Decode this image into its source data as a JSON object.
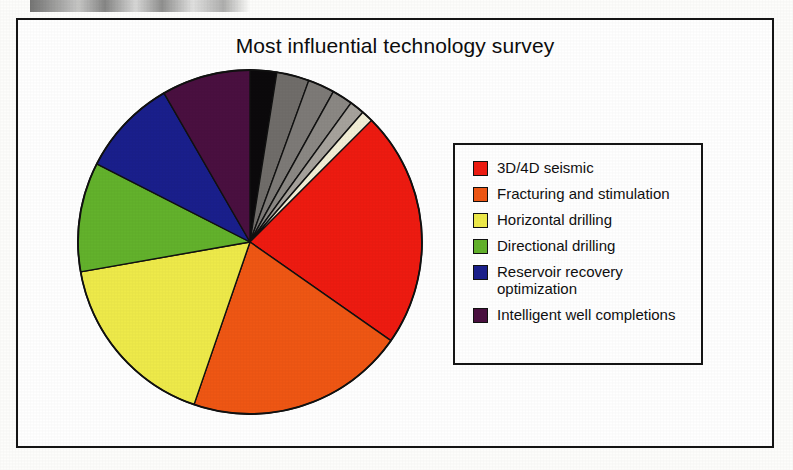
{
  "figure": {
    "title": "Most influential technology survey"
  },
  "legend": {
    "entries": [
      {
        "label": "3D/4D seismic",
        "color": "#ee1b11"
      },
      {
        "label": "Fracturing and stimulation",
        "color": "#ef5714"
      },
      {
        "label": "Horizontal drilling",
        "color": "#eeea4a"
      },
      {
        "label": "Directional drilling",
        "color": "#63b22c"
      },
      {
        "label": "Reservoir recovery\noptimization",
        "color": "#1a1f8c"
      },
      {
        "label": "Intelligent well completions",
        "color": "#4a1040"
      }
    ]
  },
  "chart_data": {
    "type": "pie",
    "title": "Most influential technology survey",
    "xlabel": "",
    "ylabel": "",
    "grid": false,
    "legend_position": "right",
    "start_angle_deg": 0,
    "direction": "clockwise",
    "slices": [
      {
        "name": "Unlabeled (black)",
        "color": "#0c0a0c",
        "angle_deg": 9,
        "value": 2.5,
        "in_legend": false
      },
      {
        "name": "Unlabeled (dark gray)",
        "color": "#706d6a",
        "angle_deg": 11,
        "value": 3.1,
        "in_legend": false
      },
      {
        "name": "Unlabeled (gray)",
        "color": "#7d7a77",
        "angle_deg": 9,
        "value": 2.5,
        "in_legend": false
      },
      {
        "name": "Unlabeled (medium gray)",
        "color": "#8b8884",
        "angle_deg": 7,
        "value": 1.9,
        "in_legend": false
      },
      {
        "name": "Unlabeled (light gray)",
        "color": "#a6a29c",
        "angle_deg": 5,
        "value": 1.4,
        "in_legend": false
      },
      {
        "name": "Unlabeled (cream)",
        "color": "#f2eed6",
        "angle_deg": 4,
        "value": 1.1,
        "in_legend": false
      },
      {
        "name": "3D/4D seismic",
        "color": "#ee1b11",
        "angle_deg": 80,
        "value": 22.2,
        "in_legend": true
      },
      {
        "name": "Fracturing and stimulation",
        "color": "#ef5714",
        "angle_deg": 74,
        "value": 20.6,
        "in_legend": true
      },
      {
        "name": "Horizontal drilling",
        "color": "#eeea4a",
        "angle_deg": 61,
        "value": 16.9,
        "in_legend": true
      },
      {
        "name": "Directional drilling",
        "color": "#63b22c",
        "angle_deg": 37,
        "value": 10.3,
        "in_legend": true
      },
      {
        "name": "Reservoir recovery optimization",
        "color": "#1a1f8c",
        "angle_deg": 33,
        "value": 9.2,
        "in_legend": true
      },
      {
        "name": "Intelligent well completions",
        "color": "#4a1040",
        "angle_deg": 30,
        "value": 8.3,
        "in_legend": true
      }
    ],
    "categories": [
      "Unlabeled (black)",
      "Unlabeled (dark gray)",
      "Unlabeled (gray)",
      "Unlabeled (medium gray)",
      "Unlabeled (light gray)",
      "Unlabeled (cream)",
      "3D/4D seismic",
      "Fracturing and stimulation",
      "Horizontal drilling",
      "Directional drilling",
      "Reservoir recovery optimization",
      "Intelligent well completions"
    ],
    "values": [
      2.5,
      3.1,
      2.5,
      1.9,
      1.4,
      1.1,
      22.2,
      20.6,
      16.9,
      10.3,
      9.2,
      8.3
    ]
  }
}
